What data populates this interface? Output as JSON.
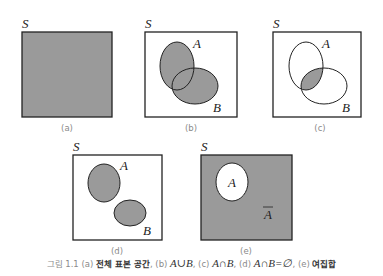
{
  "figure": {
    "colors": {
      "fill": "#9a9a9a",
      "stroke": "#222222",
      "background": "#ffffff"
    },
    "panels": [
      {
        "id": "a",
        "universe_label": "S",
        "sub_caption": "(a)",
        "description": "entire sample space shaded"
      },
      {
        "id": "b",
        "universe_label": "S",
        "sub_caption": "(b)",
        "set_labels": [
          "A",
          "B"
        ],
        "description": "A ∪ B shaded"
      },
      {
        "id": "c",
        "universe_label": "S",
        "sub_caption": "(c)",
        "set_labels": [
          "A",
          "B"
        ],
        "description": "A ∩ B shaded"
      },
      {
        "id": "d",
        "universe_label": "S",
        "sub_caption": "(d)",
        "set_labels": [
          "A",
          "B"
        ],
        "description": "disjoint A and B"
      },
      {
        "id": "e",
        "universe_label": "S",
        "sub_caption": "(e)",
        "set_labels": [
          "A",
          "Ā"
        ],
        "description": "complement of A shaded"
      }
    ],
    "caption": {
      "prefix": "그림 1.1 (a) ",
      "a_text": "전체 표본 공간",
      "b_sep": ", (b) ",
      "b_math": "A∪B",
      "c_sep": ", (c) ",
      "c_math": "A∩B",
      "d_sep": ", (d) ",
      "d_math": "A∩B=∅",
      "e_sep": ", (e) ",
      "e_text": "여집합"
    }
  }
}
